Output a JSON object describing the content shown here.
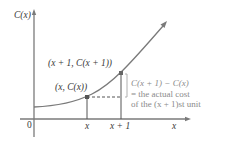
{
  "diagram": {
    "y_axis_label": "C(x)",
    "x_axis_label": "x",
    "origin_label": "0",
    "ticks": {
      "x": "x",
      "x_plus_1": "x + 1"
    },
    "points": {
      "lower": "(x, C(x))",
      "upper": "(x + 1, C(x + 1))"
    },
    "annotation": {
      "line1": "C(x + 1) − C(x)",
      "line2": "= the actual cost",
      "line3": "of the (x + 1)st unit"
    },
    "colors": {
      "axis": "#7a7a7a",
      "curve": "#7a7a7a",
      "point": "#555555",
      "bracket": "#b0b0b0",
      "annotation_text": "#8a8a8a",
      "label_text": "#3a3a3a"
    }
  }
}
